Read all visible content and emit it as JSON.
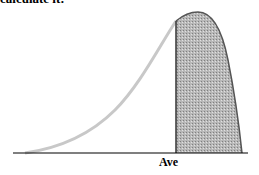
{
  "caption": "calculate it:",
  "diagram": {
    "marker_label": "Ave",
    "colors": {
      "curve_left": "#c8c8c8",
      "curve_right": "#555555",
      "shade": "#a8a8a8",
      "axis": "#000000"
    }
  }
}
